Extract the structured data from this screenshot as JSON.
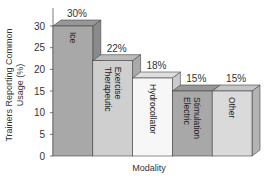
{
  "chart_data": {
    "type": "bar",
    "style": "3d",
    "title": "",
    "xlabel": "Modality",
    "ylabel": "Trainers Reporting Common Usage (%)",
    "ylabel_lines": [
      "Trainers Reporting Common",
      "Usage (%)"
    ],
    "categories": [
      "Ice",
      "Therapeutic Exercise",
      "Hydrocollator",
      "Electric Stimulation",
      "Other"
    ],
    "category_label_lines": [
      [
        "Ice"
      ],
      [
        "Therapeutic",
        "Exercise"
      ],
      [
        "Hydrocollator"
      ],
      [
        "Electric",
        "Stimulation"
      ],
      [
        "Other"
      ]
    ],
    "values": [
      30,
      22,
      18,
      15,
      15
    ],
    "data_labels": [
      "30%",
      "22%",
      "18%",
      "15%",
      "15%"
    ],
    "yticks": [
      0,
      5,
      10,
      15,
      20,
      25,
      30
    ],
    "ylim": [
      0,
      30
    ],
    "grid": false,
    "legend": null,
    "bar_colors": [
      "#a8a8a8",
      "#cfcfcf",
      "#f7f7f7",
      "#a8a8a8",
      "#dadada"
    ]
  }
}
